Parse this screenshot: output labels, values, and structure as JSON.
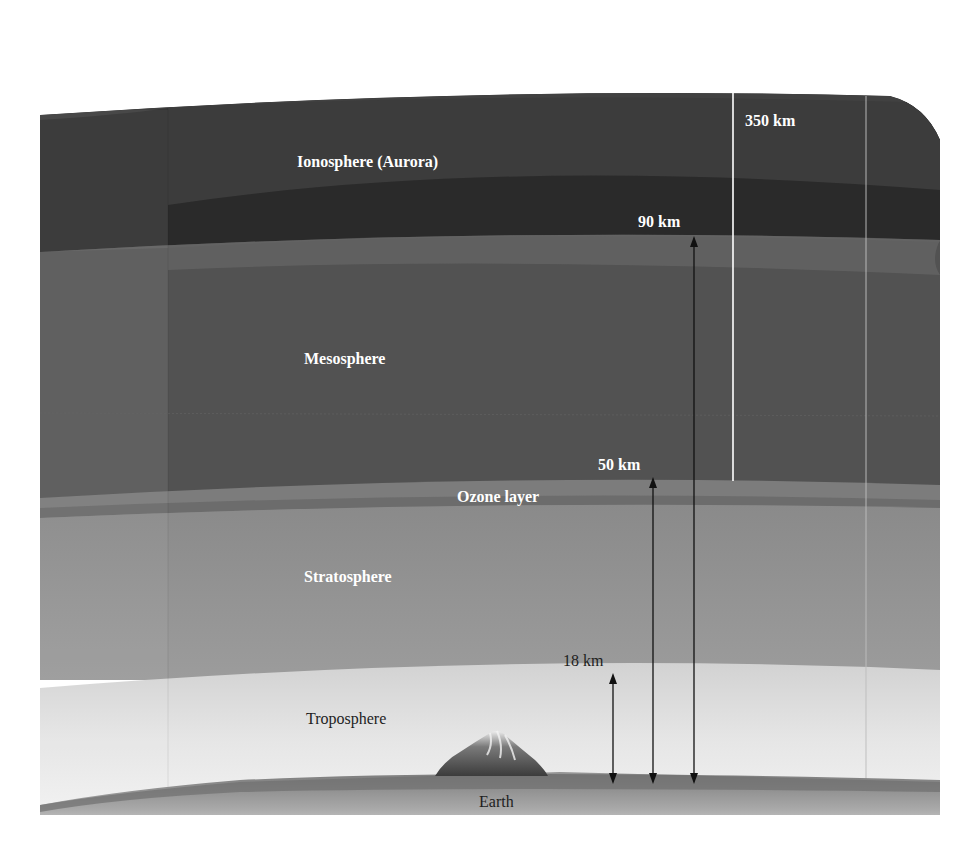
{
  "diagram": {
    "layers": [
      {
        "id": "ionosphere",
        "label": "Ionosphere (Aurora)",
        "color": "#2c2c2c",
        "side_color": "#3d3d3d"
      },
      {
        "id": "mesosphere",
        "label": "Mesosphere",
        "color": "#545454",
        "side_color": "#5f5f5f"
      },
      {
        "id": "ozone",
        "label": "Ozone layer",
        "color": "#7c7c7c",
        "band_color": "#6a6a6a"
      },
      {
        "id": "stratosphere",
        "label": "Stratosphere",
        "color": "#8e8e8e",
        "side_color": "#939393"
      },
      {
        "id": "troposphere",
        "label": "Troposphere",
        "color": "#dedede",
        "side_color": "#e4e4e4"
      },
      {
        "id": "earth",
        "label": "Earth",
        "color": "#8a8a8a"
      }
    ],
    "altitudes": [
      {
        "id": "alt-18",
        "label": "18 km",
        "value_km": 18,
        "arrow": "double",
        "arrow_color": "#111111"
      },
      {
        "id": "alt-50",
        "label": "50 km",
        "value_km": 50,
        "arrow": "double",
        "arrow_color": "#111111"
      },
      {
        "id": "alt-90",
        "label": "90 km",
        "value_km": 90,
        "arrow": "double",
        "arrow_color": "#111111"
      },
      {
        "id": "alt-350",
        "label": "350 km",
        "value_km": 350,
        "arrow": "up",
        "arrow_color": "#ffffff"
      }
    ]
  },
  "labels": {
    "ionosphere": "Ionosphere (Aurora)",
    "mesosphere": "Mesosphere",
    "ozone": "Ozone layer",
    "stratosphere": "Stratosphere",
    "troposphere": "Troposphere",
    "earth": "Earth",
    "km350": "350 km",
    "km90": "90 km",
    "km50": "50 km",
    "km18": "18 km"
  }
}
